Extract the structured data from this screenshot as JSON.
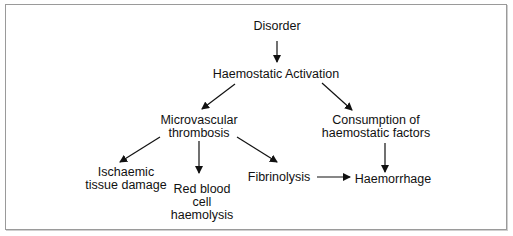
{
  "diagram": {
    "nodes": {
      "disorder": "Disorder",
      "activation": "Haemostatic Activation",
      "micro1": "Microvascular",
      "micro2": "thrombosis",
      "consumption1": "Consumption of",
      "consumption2": "haemostatic factors",
      "ischaemic1": "Ischaemic",
      "ischaemic2": "tissue damage",
      "rbc1": "Red blood",
      "rbc2": "cell",
      "rbc3": "haemolysis",
      "fibrinolysis": "Fibrinolysis",
      "haemorrhage": "Haemorrhage"
    },
    "edges": [
      [
        "Disorder",
        "Haemostatic Activation"
      ],
      [
        "Haemostatic Activation",
        "Microvascular thrombosis"
      ],
      [
        "Haemostatic Activation",
        "Consumption of haemostatic factors"
      ],
      [
        "Microvascular thrombosis",
        "Ischaemic tissue damage"
      ],
      [
        "Microvascular thrombosis",
        "Red blood cell haemolysis"
      ],
      [
        "Microvascular thrombosis",
        "Fibrinolysis"
      ],
      [
        "Fibrinolysis",
        "Haemorrhage"
      ],
      [
        "Consumption of haemostatic factors",
        "Haemorrhage"
      ]
    ]
  }
}
